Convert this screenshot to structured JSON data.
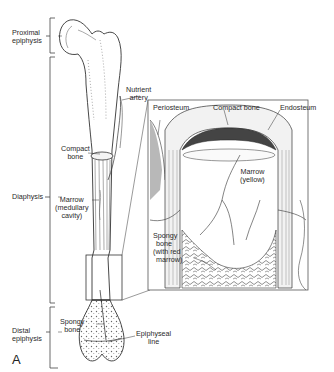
{
  "figure": {
    "panel_letter": "A"
  },
  "regions": {
    "proximal_epiphysis": [
      "Proximal",
      "epiphysis"
    ],
    "diaphysis": "Diaphysis",
    "distal_epiphysis": [
      "Distal",
      "epiphysis"
    ]
  },
  "bone_labels": {
    "nutrient_artery": [
      "Nutrient",
      "artery"
    ],
    "compact_bone": [
      "Compact",
      "bone"
    ],
    "marrow": [
      "Marrow",
      "(medullary",
      "cavity)"
    ],
    "spongy_bone": [
      "Spongy",
      "bone"
    ],
    "epiphyseal_line": [
      "Epiphyseal",
      "line"
    ]
  },
  "inset_labels": {
    "periosteum": "Periosteum",
    "compact_bone": "Compact bone",
    "endosteum": "Endosteum",
    "marrow_yellow": [
      "Marrow",
      "(yellow)"
    ],
    "spongy_bone_red": [
      "Spongy",
      "bone",
      "(with red",
      "marrow)"
    ]
  },
  "colors": {
    "line": "#333333",
    "frame": "#555555",
    "text": "#2a2a2a",
    "background": "#ffffff"
  }
}
